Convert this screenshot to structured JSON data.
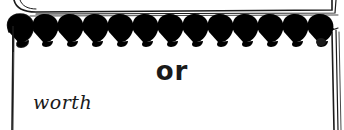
{
  "illustration": {
    "type": "spiral-notebook-card",
    "ring_count": 13,
    "colors": {
      "ink": "#1a1a1a",
      "paper": "#ffffff"
    }
  },
  "card": {
    "title": "or",
    "handwritten_word": "worth"
  }
}
